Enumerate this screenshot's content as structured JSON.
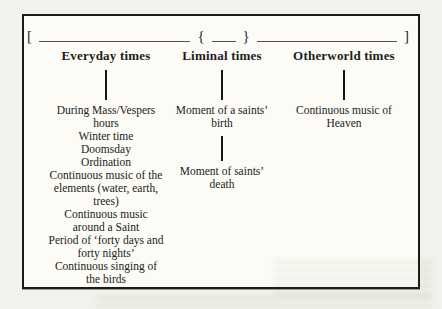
{
  "figure": {
    "bracket_row": {
      "open_bracket": "[",
      "open_brace": "{",
      "close_brace": "}",
      "close_bracket": "]"
    },
    "columns": [
      {
        "title": "Everyday times",
        "groups": [
          {
            "items": [
              [
                "During Mass/Vespers",
                "hours"
              ],
              [
                "Winter time"
              ],
              [
                "Doomsday"
              ],
              [
                "Ordination"
              ],
              [
                "Continuous music of the",
                "elements (water, earth,",
                "trees)"
              ],
              [
                "Continuous music",
                "around a Saint"
              ],
              [
                "Period of ‘forty days and",
                "forty nights’"
              ],
              [
                "Continuous singing of",
                "the birds"
              ]
            ]
          }
        ]
      },
      {
        "title": "Liminal times",
        "groups": [
          {
            "items": [
              [
                "Moment of a saints’",
                "birth"
              ]
            ]
          },
          {
            "items": [
              [
                "Moment of saints’",
                "death"
              ]
            ]
          }
        ]
      },
      {
        "title": "Otherworld times",
        "groups": [
          {
            "items": [
              [
                "Continuous music of",
                "Heaven"
              ]
            ]
          }
        ]
      }
    ],
    "colors": {
      "page_background": "#f2f1eb",
      "box_background": "#fcfbf6",
      "border": "#1a1a1a",
      "text": "#201e1b",
      "blank_line": "#55514b"
    }
  }
}
